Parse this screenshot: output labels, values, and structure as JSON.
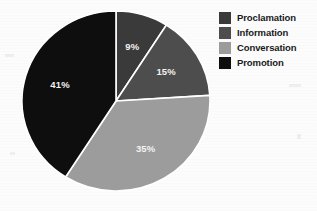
{
  "chart_data": {
    "type": "pie",
    "title": "",
    "categories": [
      "Proclamation",
      "Information",
      "Conversation",
      "Promotion"
    ],
    "values": [
      9,
      15,
      35,
      41
    ],
    "value_labels": [
      "9%",
      "15%",
      "35%",
      "41%"
    ],
    "unit": "%",
    "colors": [
      "#3a3a3a",
      "#4d4d4d",
      "#9c9c9c",
      "#0e0e0e"
    ],
    "start_angle_deg": 0,
    "direction": "clockwise",
    "slice_border_color": "#ffffff",
    "label_color": "#f2f2f2",
    "legend": {
      "position": "right",
      "entries": [
        {
          "label": "Proclamation",
          "color": "#3a3a3a"
        },
        {
          "label": "Information",
          "color": "#4d4d4d"
        },
        {
          "label": "Conversation",
          "color": "#9c9c9c"
        },
        {
          "label": "Promotion",
          "color": "#0e0e0e"
        }
      ]
    }
  },
  "pie": {
    "slices": [
      {
        "name": "Proclamation",
        "percent_label": "9%",
        "color": "#3a3a3a"
      },
      {
        "name": "Information",
        "percent_label": "15%",
        "color": "#4d4d4d"
      },
      {
        "name": "Conversation",
        "percent_label": "35%",
        "color": "#9c9c9c"
      },
      {
        "name": "Promotion",
        "percent_label": "41%",
        "color": "#0e0e0e"
      }
    ]
  },
  "legend": {
    "items": [
      {
        "label": "Proclamation",
        "color": "#3a3a3a"
      },
      {
        "label": "Information",
        "color": "#4d4d4d"
      },
      {
        "label": "Conversation",
        "color": "#9c9c9c"
      },
      {
        "label": "Promotion",
        "color": "#0e0e0e"
      }
    ]
  }
}
